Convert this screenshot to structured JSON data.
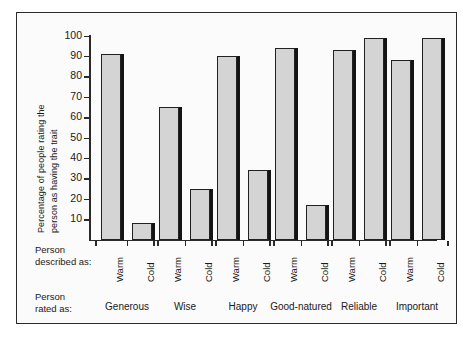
{
  "chart": {
    "ylabel_line1": "Percentage of people rating the",
    "ylabel_line2": "person as having the trait",
    "caption_described_line1": "Person",
    "caption_described_line2": "described as:",
    "caption_rated_line1": "Person",
    "caption_rated_line2": "rated as:",
    "frame_color": "#2a2a2a",
    "bar_fill": "#d4d4d4",
    "bar_edge": "#23211f",
    "bar_shadow": "#141414"
  },
  "chart_data": {
    "type": "bar",
    "title": "",
    "xlabel": "",
    "ylabel": "Percentage of people rating the person as having the trait",
    "ylim": [
      0,
      100
    ],
    "yticks": [
      10,
      20,
      30,
      40,
      50,
      60,
      70,
      80,
      90,
      100
    ],
    "ytick_labels": [
      "10",
      "20",
      "30",
      "40",
      "50",
      "60",
      "70",
      "80",
      "90",
      "100"
    ],
    "grid": false,
    "legend": "none",
    "categories": [
      "Generous",
      "Wise",
      "Happy",
      "Good-natured",
      "Reliable",
      "Important"
    ],
    "subcategories": [
      "Warm",
      "Cold"
    ],
    "series": [
      {
        "name": "Warm",
        "values": [
          91,
          65,
          90,
          94,
          93,
          88
        ]
      },
      {
        "name": "Cold",
        "values": [
          8,
          25,
          34,
          17,
          99,
          99
        ]
      }
    ]
  }
}
